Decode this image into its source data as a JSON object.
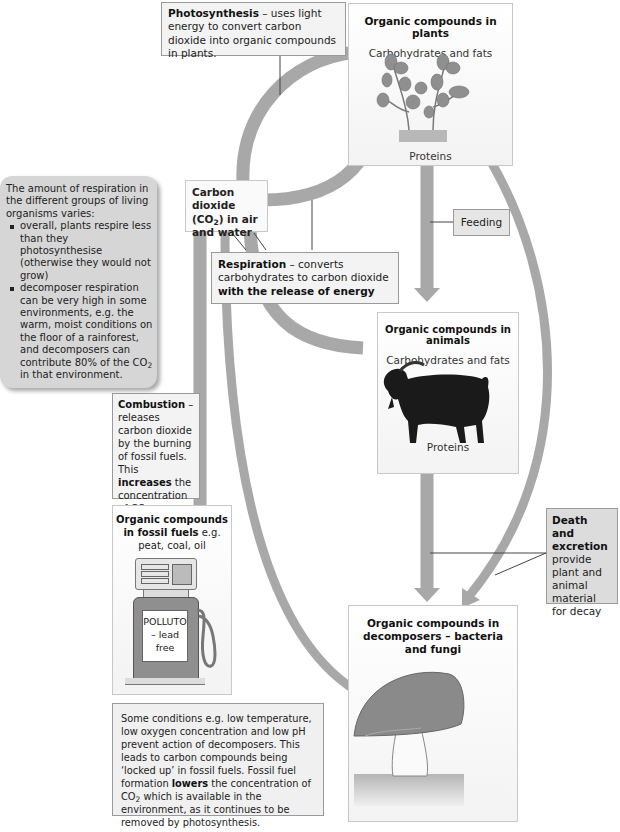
{
  "diagram": {
    "colors": {
      "arrow": "#a8a8a8",
      "box_fill": "#f3f3f3",
      "box_border": "#9a9a9a",
      "note_fill": "#d6d6d6",
      "goat": "#1a1a1a",
      "mushroom_cap": "#8a8a8a"
    },
    "photosynthesis": {
      "term": "Photosynthesis",
      "text": " – uses light energy to convert carbon dioxide into organic compounds in plants."
    },
    "plants": {
      "title": "Organic compounds in plants",
      "top_label": "Carbohydrates and fats",
      "bottom_label": "Proteins",
      "image": "plant-seedlings"
    },
    "co2": {
      "line1": "Carbon dioxide",
      "line2_pre": "(CO",
      "line2_sub": "2",
      "line2_post": ") in air",
      "line3": "and water"
    },
    "respiration_note": {
      "intro": "The amount of respiration in the different groups of living organisms varies:",
      "bullets": [
        "overall, plants respire less than they photosynthesise (otherwise they would not grow)",
        "decomposer respiration can be very high in some environments, e.g. the warm, moist conditions on the floor of a rainforest, and decomposers can contribute 80% of the CO"
      ],
      "bullet2_sub": "2",
      "bullet2_tail": " in that environment."
    },
    "feeding": {
      "label": "Feeding"
    },
    "respiration": {
      "term": "Respiration",
      "text": " – converts carbohydrates to carbon dioxide ",
      "bold_tail": "with the release of energy"
    },
    "animals": {
      "title": "Organic compounds in animals",
      "top_label": "Carbohydrates and fats",
      "bottom_label": "Proteins",
      "image": "goat"
    },
    "combustion": {
      "term": "Combustion",
      "text1": " – releases carbon dioxide by the burning of fossil fuels. This ",
      "bold": "increases",
      "text2": " the concentration of CO",
      "sub": "2",
      "text3": " available in the environment."
    },
    "fossil_fuels": {
      "title": "Organic compounds in fossil fuels",
      "suffix": " e.g.",
      "examples": "peat, coal, oil",
      "pump_line1": "POLLUTO",
      "pump_line2": "– lead",
      "pump_line3": "free"
    },
    "death": {
      "term_line1": "Death and",
      "term_line2": "excretion",
      "text": "provide plant and animal material for decay"
    },
    "decomposers": {
      "title": "Organic compounds in decomposers – bacteria and fungi",
      "image": "mushroom"
    },
    "fossil_note": {
      "text1": "Some conditions e.g. low temperature, low oxygen concentration and low pH prevent action of decomposers. This leads to carbon compounds being ‘locked up’ in fossil fuels. Fossil fuel formation ",
      "bold": "lowers",
      "text2": " the concentration of CO",
      "sub": "2",
      "text3": " which is available in the environment, as it continues to be removed by photosynthesis."
    }
  }
}
